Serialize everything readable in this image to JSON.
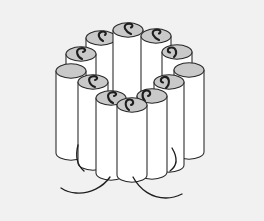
{
  "figure": {
    "title": "Bundle of cylindrical sticks arranged in a ring",
    "style": "black-and-white line art",
    "colors": {
      "background": "#f1f1f1",
      "cylinder_body": "#ffffff",
      "cylinder_top": "#c9c9c9",
      "outline": "#262626",
      "wick": "#1e1e1e"
    },
    "counts": {
      "cylinders_total": 12,
      "back_row": 5,
      "side_row": 4,
      "front_row": 3,
      "fuse_cords": 3
    },
    "cylinders": [
      {
        "id": "back-1",
        "label": "stick-1",
        "cx": 101,
        "cy": 38,
        "rx": 15,
        "ry": 7.2,
        "height": 78,
        "row": "back"
      },
      {
        "id": "back-2",
        "label": "stick-2",
        "cx": 128,
        "cy": 30,
        "rx": 15,
        "ry": 7.2,
        "height": 82,
        "row": "back"
      },
      {
        "id": "back-3",
        "label": "stick-3",
        "cx": 156,
        "cy": 36,
        "rx": 15,
        "ry": 7.2,
        "height": 80,
        "row": "back"
      },
      {
        "id": "left-1",
        "label": "stick-4",
        "cx": 81,
        "cy": 54,
        "rx": 15,
        "ry": 7.2,
        "height": 82,
        "row": "side"
      },
      {
        "id": "right-1",
        "label": "stick-5",
        "cx": 177,
        "cy": 52,
        "rx": 15,
        "ry": 7.2,
        "height": 84,
        "row": "side"
      },
      {
        "id": "left-2",
        "label": "stick-6",
        "cx": 71,
        "cy": 71,
        "rx": 15,
        "ry": 7.2,
        "height": 88,
        "row": "side"
      },
      {
        "id": "right-2",
        "label": "stick-7",
        "cx": 189,
        "cy": 70,
        "rx": 15,
        "ry": 7.2,
        "height": 88,
        "row": "side"
      },
      {
        "id": "mid-l",
        "label": "stick-8",
        "cx": 93,
        "cy": 82,
        "rx": 15,
        "ry": 7.2,
        "height": 88,
        "row": "mid"
      },
      {
        "id": "mid-r",
        "label": "stick-9",
        "cx": 169,
        "cy": 82,
        "rx": 15,
        "ry": 7.2,
        "height": 90,
        "row": "mid"
      },
      {
        "id": "front-1",
        "label": "stick-10",
        "cx": 111,
        "cy": 98,
        "rx": 15,
        "ry": 7.2,
        "height": 82,
        "row": "front"
      },
      {
        "id": "front-3",
        "label": "stick-11",
        "cx": 152,
        "cy": 96,
        "rx": 15,
        "ry": 7.2,
        "height": 84,
        "row": "front"
      },
      {
        "id": "front-2",
        "label": "stick-12",
        "cx": 132,
        "cy": 105,
        "rx": 15,
        "ry": 7.2,
        "height": 78,
        "row": "front"
      }
    ]
  }
}
